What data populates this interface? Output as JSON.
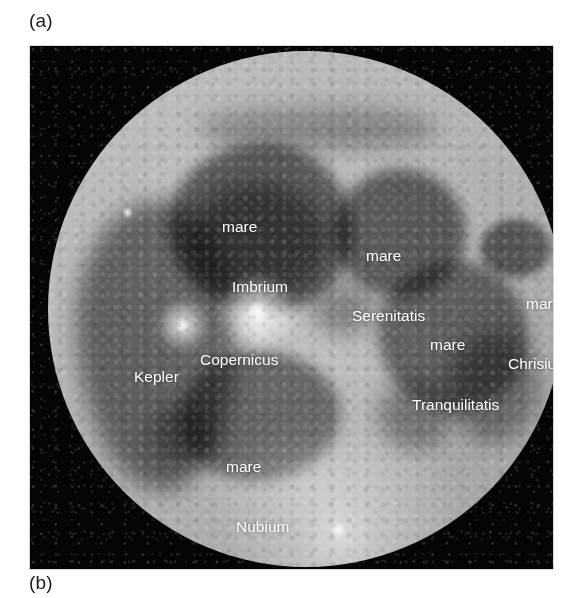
{
  "figure": {
    "panel_a_label": "(a)",
    "panel_b_label": "(b)"
  },
  "photo": {
    "subject": "full-moon-near-side",
    "sky_color": "#050505",
    "disc_color": "#b2b2b0",
    "label_color": "#ffffff"
  },
  "labels": {
    "imbrium": {
      "line1": "mare",
      "line2": "Imbrium"
    },
    "serenitatis": {
      "line1": "mare",
      "line2": "Serenitatis"
    },
    "chrisium": {
      "line1": "mare",
      "line2": "Chrisium"
    },
    "tranquilitatis": {
      "line1": "mare",
      "line2": "Tranquilitatis"
    },
    "copernicus": {
      "line1": "Copernicus"
    },
    "kepler": {
      "line1": "Kepler"
    },
    "nubium": {
      "line1": "mare",
      "line2": "Nubium"
    },
    "tycho": {
      "line1": "Tycho"
    }
  }
}
